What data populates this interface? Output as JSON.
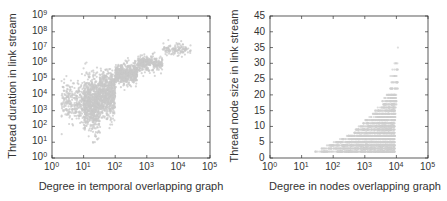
{
  "chart_data": [
    {
      "type": "scatter",
      "title": "",
      "xlabel": "Degree in temporal overlapping graph",
      "ylabel": "Thread duration in link stream",
      "xscale": "log",
      "yscale": "log",
      "xlim": [
        1,
        100000
      ],
      "ylim": [
        1,
        1000000000
      ],
      "x_ticks": [
        {
          "base": "10",
          "exp": "0"
        },
        {
          "base": "10",
          "exp": "1"
        },
        {
          "base": "10",
          "exp": "2"
        },
        {
          "base": "10",
          "exp": "3"
        },
        {
          "base": "10",
          "exp": "4"
        },
        {
          "base": "10",
          "exp": "5"
        }
      ],
      "y_ticks": [
        {
          "base": "10",
          "exp": "0"
        },
        {
          "base": "10",
          "exp": "1"
        },
        {
          "base": "10",
          "exp": "2"
        },
        {
          "base": "10",
          "exp": "3"
        },
        {
          "base": "10",
          "exp": "4"
        },
        {
          "base": "10",
          "exp": "5"
        },
        {
          "base": "10",
          "exp": "6"
        },
        {
          "base": "10",
          "exp": "7"
        },
        {
          "base": "10",
          "exp": "8"
        },
        {
          "base": "10",
          "exp": "9"
        }
      ],
      "grid": false,
      "legend": null,
      "marker_color": "#c8c8c8",
      "description": "Dense gray point cloud; degrees from ~2 to ~2e4; durations from ~10 to ~1e8; mass concentrated at degree 10-100 with durations 1e2-1e5, then a narrowing band rising roughly linearly in log-log space to ~1e7-1e8 at degree 1e4.",
      "point_cloud": [
        {
          "x_log_range": [
            0.3,
            1.0
          ],
          "y_log_center": 3.6,
          "y_log_spread": 1.0,
          "count": 260
        },
        {
          "x_log_range": [
            1.0,
            1.5
          ],
          "y_log_center": 3.4,
          "y_log_spread": 1.4,
          "count": 700
        },
        {
          "x_log_range": [
            1.5,
            2.0
          ],
          "y_log_center": 4.0,
          "y_log_spread": 1.2,
          "count": 650
        },
        {
          "x_log_range": [
            2.0,
            2.7
          ],
          "y_log_center": 5.3,
          "y_log_spread": 0.55,
          "count": 500
        },
        {
          "x_log_range": [
            2.7,
            3.5
          ],
          "y_log_center": 6.0,
          "y_log_spread": 0.4,
          "count": 300
        },
        {
          "x_log_range": [
            3.5,
            4.4
          ],
          "y_log_center": 6.9,
          "y_log_spread": 0.35,
          "count": 120
        }
      ]
    },
    {
      "type": "scatter",
      "title": "",
      "xlabel": "Degree in nodes overlapping graph",
      "ylabel": "Thread node size in link stream",
      "xscale": "log",
      "yscale": "linear",
      "xlim": [
        1,
        100000
      ],
      "ylim": [
        0,
        45
      ],
      "x_ticks": [
        {
          "base": "10",
          "exp": "0"
        },
        {
          "base": "10",
          "exp": "1"
        },
        {
          "base": "10",
          "exp": "2"
        },
        {
          "base": "10",
          "exp": "3"
        },
        {
          "base": "10",
          "exp": "4"
        },
        {
          "base": "10",
          "exp": "5"
        }
      ],
      "y_ticks": [
        "0",
        "5",
        "10",
        "15",
        "20",
        "25",
        "30",
        "35",
        "40",
        "45"
      ],
      "grid": false,
      "legend": null,
      "marker_color": "#cfcfcf",
      "description": "Gray points in integer rows (node sizes 2 to ~30). Degree range ~10 to ~1.2e4. Small sizes (2-5) span degree 30-1e4; larger sizes only at high degree (~1e3-1e4), forming a rising wall near degree 1e4 up to ~30.",
      "point_rows": [
        {
          "y": 2,
          "x_log_range": [
            1.4,
            3.95
          ],
          "count": 260
        },
        {
          "y": 3,
          "x_log_range": [
            1.6,
            3.95
          ],
          "count": 260
        },
        {
          "y": 4,
          "x_log_range": [
            1.8,
            3.95
          ],
          "count": 240
        },
        {
          "y": 5,
          "x_log_range": [
            2.0,
            3.95
          ],
          "count": 220
        },
        {
          "y": 6,
          "x_log_range": [
            2.2,
            3.95
          ],
          "count": 190
        },
        {
          "y": 7,
          "x_log_range": [
            2.4,
            3.95
          ],
          "count": 170
        },
        {
          "y": 8,
          "x_log_range": [
            2.6,
            3.95
          ],
          "count": 150
        },
        {
          "y": 9,
          "x_log_range": [
            2.7,
            3.95
          ],
          "count": 130
        },
        {
          "y": 10,
          "x_log_range": [
            2.8,
            3.95
          ],
          "count": 110
        },
        {
          "y": 11,
          "x_log_range": [
            2.9,
            3.95
          ],
          "count": 90
        },
        {
          "y": 12,
          "x_log_range": [
            3.0,
            3.97
          ],
          "count": 80
        },
        {
          "y": 13,
          "x_log_range": [
            3.1,
            3.97
          ],
          "count": 70
        },
        {
          "y": 14,
          "x_log_range": [
            3.2,
            3.98
          ],
          "count": 60
        },
        {
          "y": 15,
          "x_log_range": [
            3.3,
            3.98
          ],
          "count": 50
        },
        {
          "y": 16,
          "x_log_range": [
            3.4,
            4.0
          ],
          "count": 40
        },
        {
          "y": 17,
          "x_log_range": [
            3.5,
            4.0
          ],
          "count": 35
        },
        {
          "y": 18,
          "x_log_range": [
            3.5,
            4.0
          ],
          "count": 30
        },
        {
          "y": 19,
          "x_log_range": [
            3.6,
            4.0
          ],
          "count": 25
        },
        {
          "y": 20,
          "x_log_range": [
            3.6,
            4.0
          ],
          "count": 22
        },
        {
          "y": 22,
          "x_log_range": [
            3.7,
            4.05
          ],
          "count": 15
        },
        {
          "y": 24,
          "x_log_range": [
            3.75,
            4.05
          ],
          "count": 12
        },
        {
          "y": 26,
          "x_log_range": [
            3.8,
            4.05
          ],
          "count": 8
        },
        {
          "y": 28,
          "x_log_range": [
            3.85,
            4.05
          ],
          "count": 6
        },
        {
          "y": 30,
          "x_log_range": [
            3.9,
            4.05
          ],
          "count": 4
        },
        {
          "y": 35,
          "x_log_range": [
            4.0,
            4.05
          ],
          "count": 1
        }
      ]
    }
  ]
}
